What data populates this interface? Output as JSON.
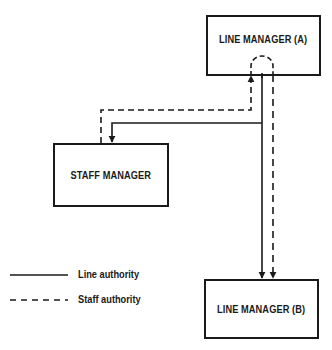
{
  "nodes": {
    "line_manager_a": {
      "label": "LINE MANAGER (A)"
    },
    "staff_manager": {
      "label": "STAFF MANAGER"
    },
    "line_manager_b": {
      "label": "LINE MANAGER (B)"
    }
  },
  "legend": {
    "items": [
      {
        "style": "solid",
        "label": "Line authority"
      },
      {
        "style": "dashed",
        "label": "Staff authority"
      }
    ]
  },
  "edges": [
    {
      "from": "line_manager_a",
      "to": "staff_manager",
      "type": "line authority"
    },
    {
      "from": "line_manager_a",
      "to": "line_manager_b",
      "type": "line authority"
    },
    {
      "from": "staff_manager",
      "to": "line_manager_a",
      "type": "staff authority"
    },
    {
      "from": "line_manager_a",
      "to": "line_manager_b",
      "type": "staff authority"
    }
  ],
  "colors": {
    "ink": "#1a1a1a",
    "background": "#ffffff"
  }
}
